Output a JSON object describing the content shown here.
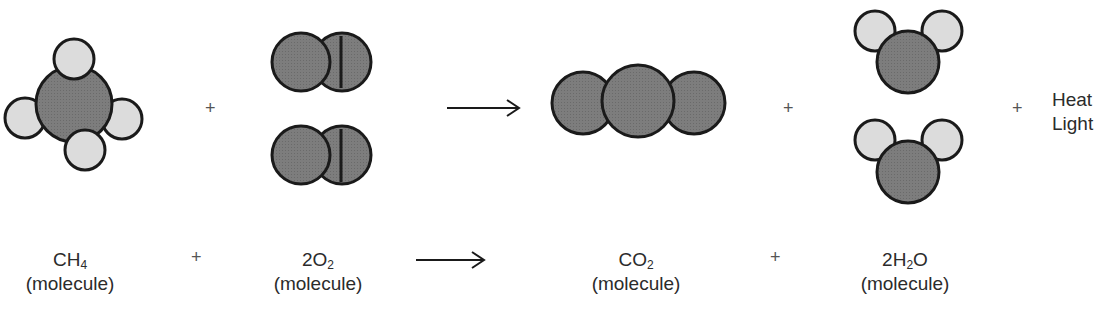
{
  "colors": {
    "carbon_oxygen_fill": "#7a7a7a",
    "hydrogen_fill": "#dcdcdc",
    "outline": "#1a1a1a",
    "background": "#ffffff"
  },
  "top_row": {
    "molecules": [
      {
        "id": "ch4",
        "atoms": "1 C + 4 H",
        "model": "methane space-filling"
      },
      {
        "id": "o2",
        "count": 2,
        "model": "oxygen diatomic"
      },
      {
        "id": "co2",
        "count": 1,
        "model": "carbon dioxide linear"
      },
      {
        "id": "h2o",
        "count": 2,
        "model": "water bent"
      }
    ],
    "operators": [
      "+",
      "→",
      "+",
      "+"
    ],
    "energy": {
      "line1": "Heat",
      "line2": "Light"
    }
  },
  "bottom_row": {
    "terms": [
      {
        "formula_main": "CH",
        "formula_sub": "4",
        "formula_tail": "",
        "prefix": "",
        "desc": "(molecule)"
      },
      {
        "formula_main": "O",
        "formula_sub": "2",
        "formula_tail": "",
        "prefix": "2",
        "desc": "(molecule)"
      },
      {
        "formula_main": "CO",
        "formula_sub": "2",
        "formula_tail": "",
        "prefix": "",
        "desc": "(molecule)"
      },
      {
        "formula_main": "H",
        "formula_sub": "2",
        "formula_tail": "O",
        "prefix": "2",
        "desc": "(molecule)"
      }
    ],
    "operators": [
      "+",
      "→",
      "+"
    ]
  },
  "symbols": {
    "plus": "+"
  }
}
